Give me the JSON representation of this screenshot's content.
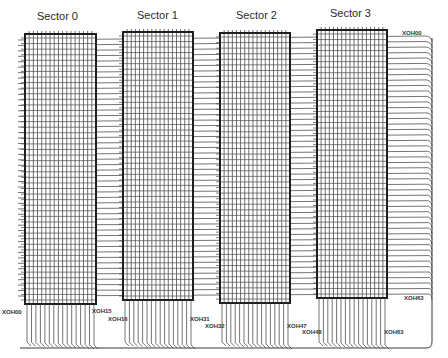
{
  "diagram": {
    "type": "memory-array-wiring",
    "sectors": [
      {
        "label": "Sector 0",
        "x": 25,
        "y": 34,
        "w": 71,
        "h": 270,
        "title_x": 58,
        "title_y": 20
      },
      {
        "label": "Sector 1",
        "x": 123,
        "y": 32,
        "w": 70,
        "h": 268,
        "title_x": 156,
        "title_y": 18
      },
      {
        "label": "Sector 2",
        "x": 220,
        "y": 33,
        "w": 70,
        "h": 270,
        "title_x": 256,
        "title_y": 19
      },
      {
        "label": "Sector 3",
        "x": 317,
        "y": 30,
        "w": 70,
        "h": 268,
        "title_x": 348,
        "title_y": 17
      }
    ],
    "labels": {
      "top_right": "XOH00",
      "right_bottom": "XOH63",
      "bottom": [
        {
          "text": "XOH00",
          "x": 2,
          "y": 314
        },
        {
          "text": "XOH15",
          "x": 92,
          "y": 313
        },
        {
          "text": "XOH16",
          "x": 108,
          "y": 321
        },
        {
          "text": "XOH31",
          "x": 190,
          "y": 321
        },
        {
          "text": "XOH32",
          "x": 205,
          "y": 328
        },
        {
          "text": "XOH47",
          "x": 287,
          "y": 328
        },
        {
          "text": "XOH48",
          "x": 302,
          "y": 334
        },
        {
          "text": "XOH63",
          "x": 384,
          "y": 334
        }
      ]
    },
    "colors": {
      "line": "#3a3a3a",
      "grid": "#4a4a4a",
      "border": "#1e1e1e",
      "background": "#ffffff"
    },
    "grid_columns": 16,
    "horizontal_lines": 48,
    "right_bus_x": 432,
    "bottom_bus_y": 348
  }
}
